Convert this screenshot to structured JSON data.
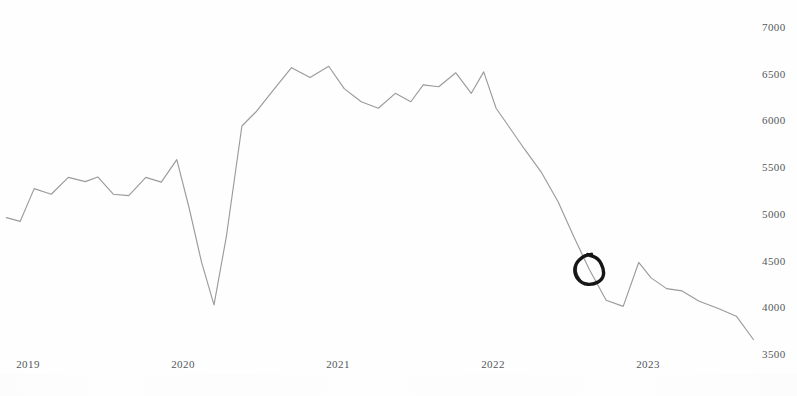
{
  "chart_data": {
    "type": "line",
    "title": "",
    "subtitle": "",
    "xlabel": "",
    "ylabel": "",
    "grid": false,
    "legend": "none",
    "line_color": "#9b9b9e",
    "background_color": "#fefefe",
    "annotation_color": "#151515",
    "xlim": [
      2018.83,
      2023.75
    ],
    "ylim": [
      3500,
      7100
    ],
    "y_ticks": [
      7000,
      6500,
      6000,
      5500,
      5000,
      4500,
      4000,
      3500
    ],
    "y_tick_labels": [
      "7000",
      "6500",
      "6000",
      "5500",
      "5000",
      "4500",
      "4000",
      "3500"
    ],
    "x_ticks": [
      2019,
      2020,
      2021,
      2022,
      2023
    ],
    "x_tick_labels": [
      "2019",
      "2020",
      "2021",
      "2022",
      "2023"
    ],
    "annotations": [
      {
        "type": "hand-drawn-circle",
        "label": "circled-data-point",
        "x": 2022.62,
        "y": 4400,
        "radius_px": 15
      }
    ],
    "series": [
      {
        "name": "series-1",
        "x": [
          2018.86,
          2018.95,
          2019.04,
          2019.15,
          2019.26,
          2019.37,
          2019.45,
          2019.55,
          2019.65,
          2019.76,
          2019.86,
          2019.96,
          2020.04,
          2020.12,
          2020.2,
          2020.28,
          2020.38,
          2020.47,
          2020.58,
          2020.7,
          2020.82,
          2020.94,
          2021.04,
          2021.15,
          2021.26,
          2021.37,
          2021.47,
          2021.55,
          2021.65,
          2021.76,
          2021.86,
          2021.94,
          2022.02,
          2022.1,
          2022.2,
          2022.31,
          2022.42,
          2022.52,
          2022.62,
          2022.73,
          2022.84,
          2022.94,
          2023.02,
          2023.12,
          2023.22,
          2023.33,
          2023.45,
          2023.57,
          2023.68
        ],
        "y": [
          4960,
          4920,
          5270,
          5210,
          5390,
          5345,
          5395,
          5210,
          5195,
          5390,
          5340,
          5580,
          5060,
          4480,
          4025,
          4760,
          5940,
          6090,
          6320,
          6565,
          6460,
          6580,
          6340,
          6200,
          6130,
          6290,
          6200,
          6380,
          6360,
          6510,
          6290,
          6520,
          6130,
          5940,
          5700,
          5450,
          5130,
          4760,
          4410,
          4075,
          4010,
          4480,
          4315,
          4200,
          4175,
          4065,
          3990,
          3905,
          3655
        ]
      }
    ]
  },
  "axis": {
    "y_label_color": "#53575c",
    "x_label_color": "#53575c"
  }
}
